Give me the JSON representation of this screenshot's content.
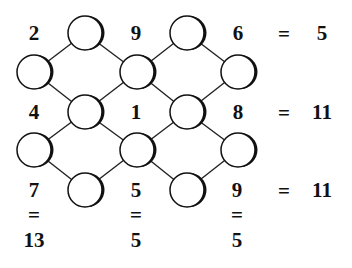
{
  "puzzle": {
    "row_clues": [
      {
        "left": "2",
        "mid": "9",
        "right": "6",
        "equals": "=",
        "sum": "5"
      },
      {
        "left": "4",
        "mid": "1",
        "right": "8",
        "equals": "=",
        "sum": "11"
      },
      {
        "left": "7",
        "mid": "5",
        "right": "9",
        "equals": "=",
        "sum": "11"
      }
    ],
    "column_results": [
      {
        "equals": "=",
        "sum": "13"
      },
      {
        "equals": "=",
        "sum": "5"
      },
      {
        "equals": "=",
        "sum": "5"
      }
    ],
    "circles": [
      {
        "id": "c1",
        "x": 85,
        "y": 33
      },
      {
        "id": "c2",
        "x": 187,
        "y": 33
      },
      {
        "id": "c3",
        "x": 34,
        "y": 72
      },
      {
        "id": "c4",
        "x": 137,
        "y": 72
      },
      {
        "id": "c5",
        "x": 238,
        "y": 72
      },
      {
        "id": "c6",
        "x": 85,
        "y": 112
      },
      {
        "id": "c7",
        "x": 187,
        "y": 112
      },
      {
        "id": "c8",
        "x": 34,
        "y": 150
      },
      {
        "id": "c9",
        "x": 137,
        "y": 150
      },
      {
        "id": "c10",
        "x": 238,
        "y": 150
      },
      {
        "id": "c11",
        "x": 85,
        "y": 190
      },
      {
        "id": "c12",
        "x": 187,
        "y": 190
      }
    ]
  }
}
